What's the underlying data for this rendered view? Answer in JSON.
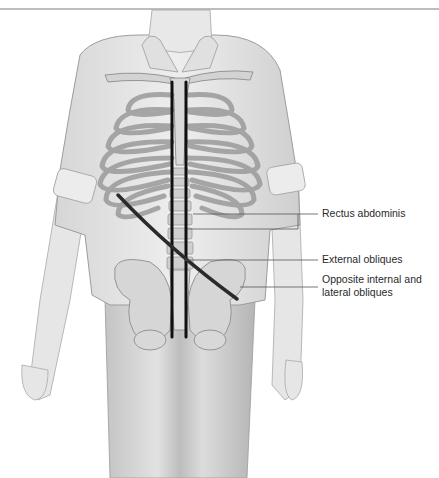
{
  "figure": {
    "type": "anatomical-illustration",
    "labels": [
      {
        "id": "rectus",
        "text": "Rectus abdominis"
      },
      {
        "id": "external",
        "text": "External obliques"
      },
      {
        "id": "opposite",
        "text": "Opposite internal and lateral obliques"
      }
    ]
  },
  "colors": {
    "rule": "#bdbdbd",
    "body_fill": "#e4e4e4",
    "bone_fill": "#d2d2d2",
    "muscle_line": "#111111",
    "leader_line": "#555555",
    "label_text": "#2a2a2a"
  }
}
